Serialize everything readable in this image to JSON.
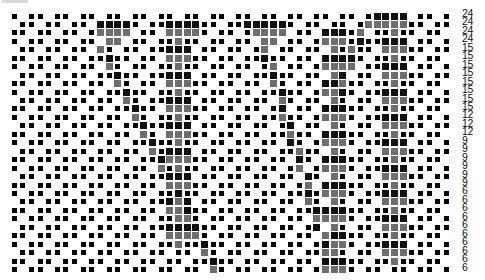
{
  "caption": "",
  "grid": {
    "cols": 51,
    "rows": 31,
    "origin_x": 14,
    "origin_y": 16,
    "pitch_x": 8.65,
    "pitch_y": 8.45,
    "background_rule": "cell off when col mod 3 == (1 - row) mod 3",
    "colors": {
      "dot": "#000000",
      "track": "#6e6e6e",
      "track_dark": "#111111"
    },
    "heads": [
      {
        "row": 1,
        "cols": [
          27,
          28,
          29,
          30,
          31
        ],
        "shade": "dark"
      },
      {
        "row": 2,
        "cols": [
          28,
          29,
          30,
          31
        ],
        "shade": "gray"
      },
      {
        "row": 3,
        "cols": [
          29,
          30
        ],
        "shade": "gray"
      },
      {
        "row": 1,
        "cols": [
          10,
          11,
          12,
          13
        ],
        "shade": "dark"
      },
      {
        "row": 2,
        "cols": [
          10,
          11,
          12,
          13
        ],
        "shade": "gray"
      },
      {
        "row": 3,
        "cols": [
          11,
          12
        ],
        "shade": "gray"
      },
      {
        "row": 1,
        "cols": [
          20,
          21
        ],
        "shade": "dark"
      },
      {
        "row": 2,
        "cols": [
          20,
          21
        ],
        "shade": "gray"
      },
      {
        "row": 0,
        "cols": [
          42,
          43,
          44
        ],
        "shade": "dark"
      },
      {
        "row": 1,
        "cols": [
          41,
          42,
          43
        ],
        "shade": "gray"
      }
    ],
    "diagonals": [
      {
        "start_col": 10,
        "start_row": 4,
        "end_row": 30,
        "cols_per_row": 0.5
      },
      {
        "start_col": 29,
        "start_row": 4,
        "end_row": 29,
        "cols_per_row": 0.3
      },
      {
        "start_col": 40,
        "start_row": 2,
        "end_row": 9,
        "cols_per_row": -0.35
      }
    ],
    "columns": [
      {
        "center_col": 19,
        "start_row": 1,
        "end_row": 27
      },
      {
        "center_col": 37,
        "start_row": 2,
        "end_row": 30
      },
      {
        "center_col": 44,
        "start_row": 0,
        "end_row": 29
      }
    ]
  },
  "row_labels": [
    "24",
    "24",
    "24",
    "24",
    "15",
    "15",
    "15",
    "15",
    "15",
    "15",
    "15",
    "15",
    "12",
    "12",
    "12",
    "9",
    "9",
    "9",
    "9",
    "9",
    "9",
    "6",
    "6",
    "6",
    "6",
    "6",
    "6",
    "6",
    "6",
    "6",
    "6"
  ]
}
